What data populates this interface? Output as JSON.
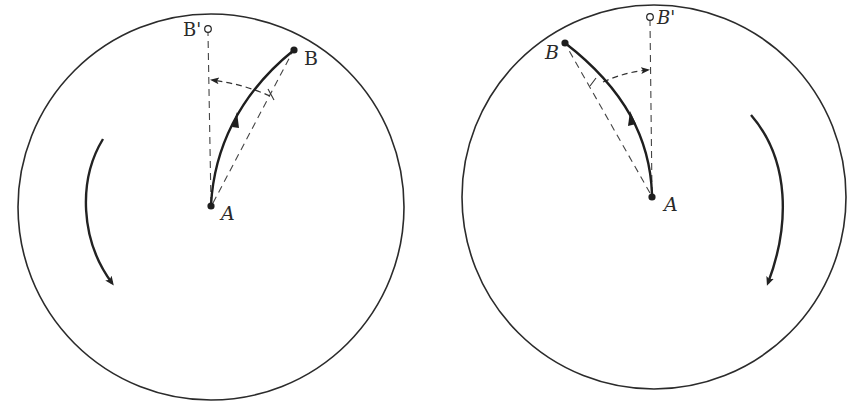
{
  "figure": {
    "caption_fragment": "y   g",
    "colors": {
      "ink": "#222222",
      "dashed": "#444444",
      "background": "#ffffff"
    },
    "panels": [
      {
        "id": "left",
        "rotation": "counterclockwise",
        "circle": {
          "cx": 211,
          "cy": 207,
          "r": 193
        },
        "labels": {
          "origin": "A",
          "target": "B",
          "ghost_target": "B'"
        },
        "points": {
          "A": [
            211,
            206
          ],
          "B": [
            294,
            50
          ],
          "B_prime": [
            208,
            29
          ]
        },
        "notes": "Curved path from A to B bends left; dashed straight line A-B and dashed line A-B'; dashed deflection arc with arrow pointing left toward B' line."
      },
      {
        "id": "right",
        "rotation": "clockwise",
        "circle": {
          "cx": 654,
          "cy": 197,
          "r": 192
        },
        "labels": {
          "origin": "A",
          "target": "B",
          "ghost_target": "B'"
        },
        "points": {
          "A": [
            652,
            197
          ],
          "B": [
            565,
            43
          ],
          "B_prime": [
            650,
            17
          ]
        },
        "notes": "Curved path from A to B bends right; dashed straight line A-B and dashed line A-B'; dashed deflection arc with arrow pointing right toward B' line."
      }
    ]
  }
}
